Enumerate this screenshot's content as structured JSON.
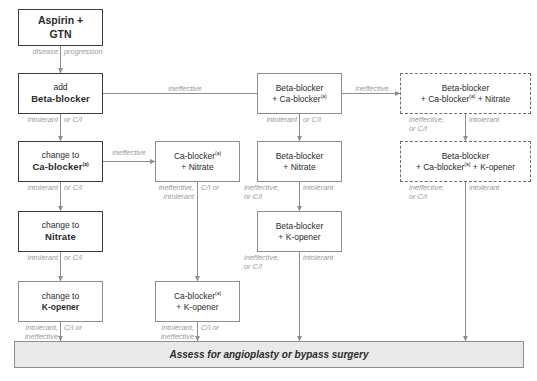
{
  "diagram": {
    "superscript": "(a)",
    "colors": {
      "primary_border": "#3d3d3d",
      "secondary_border": "#8e8e8e",
      "dashed_border": "#6f6f6f",
      "banner_fill": "#e9e9e9",
      "label_text": "#9a9a9a",
      "node_text": "#2b2b2b",
      "arrow": "#8e8e8e"
    },
    "nodes": [
      {
        "id": "aspirin",
        "line1": "Aspirin +",
        "line2": "GTN",
        "bold1": true,
        "bold2": true,
        "style": "top"
      },
      {
        "id": "add_bb",
        "line1": "add",
        "line2": "Beta-blocker",
        "bold1": false,
        "bold2": true,
        "style": "primary"
      },
      {
        "id": "chg_cab",
        "line1": "change to",
        "line2": "Ca-blocker",
        "bold1": false,
        "bold2": true,
        "style": "primary",
        "sup2": true
      },
      {
        "id": "chg_nit",
        "line1": "change to",
        "line2": "Nitrate",
        "bold1": false,
        "bold2": true,
        "style": "primary"
      },
      {
        "id": "chg_kop",
        "line1": "change to",
        "line2": "K-opener",
        "bold1": false,
        "bold2": true,
        "style": "secondary"
      },
      {
        "id": "cab_nit",
        "line1": "Ca-blocker",
        "line2": "+ Nitrate",
        "bold1": false,
        "bold2": false,
        "style": "secondary",
        "sup1": true
      },
      {
        "id": "cab_kop",
        "line1": "Ca-blocker",
        "line2": "+ K-opener",
        "bold1": false,
        "bold2": false,
        "style": "secondary",
        "sup1": true
      },
      {
        "id": "bb_cab",
        "line1": "Beta-blocker",
        "line2": "+ Ca-blocker",
        "bold1": false,
        "bold2": false,
        "style": "secondary",
        "sup2": true
      },
      {
        "id": "bb_nit",
        "line1": "Beta-blocker",
        "line2": "+ Nitrate",
        "bold1": false,
        "bold2": false,
        "style": "secondary"
      },
      {
        "id": "bb_kop",
        "line1": "Beta-blocker",
        "line2": "+ K-opener",
        "bold1": false,
        "bold2": false,
        "style": "secondary"
      },
      {
        "id": "bb_cab_nit",
        "line1": "Beta-blocker",
        "line2": "+ Ca-blocker + Nitrate",
        "bold1": false,
        "bold2": false,
        "style": "dashed",
        "sup_mid": true
      },
      {
        "id": "bb_cab_kop",
        "line1": "Beta-blocker",
        "line2": "+ Ca-blocker + K-opener",
        "bold1": false,
        "bold2": false,
        "style": "dashed",
        "sup_mid": true
      }
    ],
    "banner": {
      "text": "Assess for angioplasty or bypass surgery"
    },
    "edge_labels": {
      "disease": "disease",
      "progression": "progression",
      "intolerant_left1": "intolerant",
      "orci_left1": "or C/I",
      "intolerant_left2": "intolerant",
      "orci_left2": "or C/I",
      "intolerant_left3": "intolerant",
      "orci_left3": "or C/I",
      "intolerant_ineff_left4": "intolerant,\nineffective",
      "ci_or_left4": "C/I or",
      "ineffective_to_cabnit": "ineffective",
      "ineff_intol_col2": "ineffective,\nintolerant",
      "ci_or_col2": "C/I or",
      "intolerant_ineff_col2b": "intolerant,\nineffective",
      "ci_or_col2b": "C/I or",
      "ineffective_to_bbcab": "ineffective",
      "intolerant_col3": "intolerant",
      "orci_col3": "or C/I",
      "ineff_orci_col3b": "ineffective,\nor C/I",
      "intolerant_col3b": "intolerant",
      "ineff_orci_col3c": "ineffective,\nor C/I",
      "intolerant_col3c": "intolerant",
      "ineffective_to_dashed": "ineffective",
      "ineff_orci_col4": "ineffective,\nor C/I",
      "intolerant_col4": "intolerant",
      "ineff_orci_col4b": "ineffective,\nor C/I",
      "intolerant_col4b": "intolerant"
    }
  }
}
